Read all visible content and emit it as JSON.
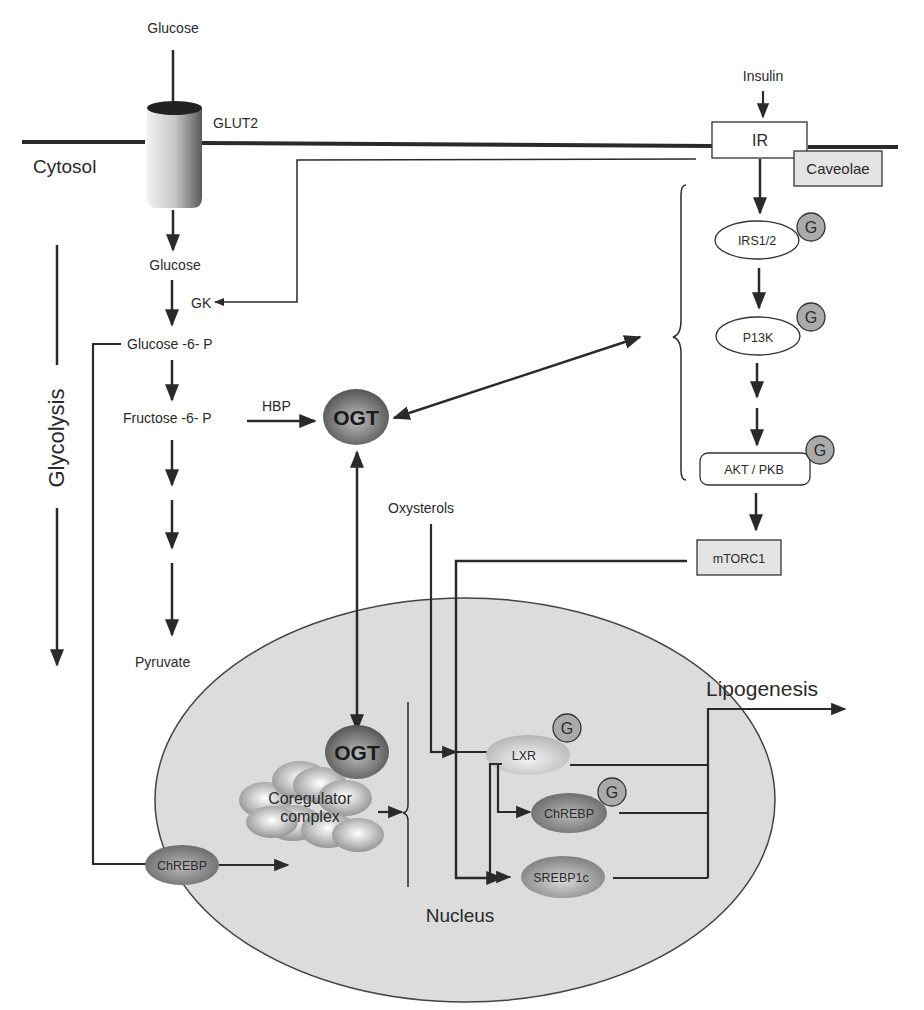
{
  "figure": {
    "compartments": {
      "cytosol": "Cytosol",
      "nucleus": "Nucleus"
    },
    "membrane": {
      "transporter": "GLUT2",
      "receptor": "IR",
      "raft": "Caveolae"
    },
    "glycolysis": {
      "label": "Glycolysis",
      "steps": [
        "Glucose",
        "Glucose",
        "Glucose -6- P",
        "Fructose -6- P",
        "Pyruvate"
      ],
      "enzyme": "GK",
      "branch": "HBP"
    },
    "insulin_pathway": {
      "ligand": "Insulin",
      "nodes": [
        "IRS1/2",
        "P13K",
        "AKT / PKB",
        "mTORC1"
      ]
    },
    "ogt": {
      "cytosolic": "OGT",
      "nuclear": "OGT"
    },
    "coregulator": {
      "line1": "Coregulator",
      "line2": "complex"
    },
    "transcription_factors": {
      "cytosolic_chrebp": "ChREBP",
      "lxr": "LXR",
      "chrebp": "ChREBP",
      "srebp1c": "SREBP1c"
    },
    "inputs": {
      "oxysterols": "Oxysterols"
    },
    "output": {
      "lipogenesis": "Lipogenesis"
    },
    "glcnac_marker": "G"
  }
}
